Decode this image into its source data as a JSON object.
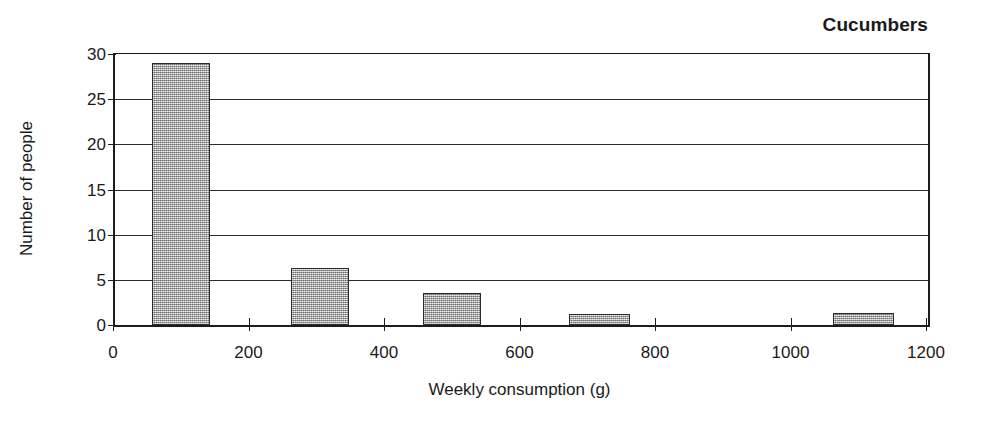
{
  "chart_data": {
    "type": "bar",
    "title": "Cucumbers",
    "xlabel": "Weekly consumption (g)",
    "ylabel": "Number of people",
    "xlim": [
      0,
      1200
    ],
    "ylim": [
      0,
      30
    ],
    "grid": true,
    "legend": "none",
    "xticks": [
      0,
      200,
      400,
      600,
      800,
      1000,
      1200
    ],
    "xtick_labels": [
      "0",
      "200",
      "400",
      "600",
      "800",
      "1000",
      "1200"
    ],
    "yticks": [
      0,
      5,
      10,
      15,
      20,
      25,
      30
    ],
    "ytick_labels": [
      "0",
      "5",
      "10",
      "15",
      "20",
      "25",
      "30"
    ],
    "bars": [
      {
        "bin_start": 55,
        "bin_end": 140,
        "value": 29.0
      },
      {
        "bin_start": 260,
        "bin_end": 345,
        "value": 6.3
      },
      {
        "bin_start": 455,
        "bin_end": 540,
        "value": 3.5
      },
      {
        "bin_start": 670,
        "bin_end": 760,
        "value": 1.2
      },
      {
        "bin_start": 1060,
        "bin_end": 1150,
        "value": 1.3
      }
    ],
    "categories": [
      "55-140",
      "260-345",
      "455-540",
      "670-760",
      "1060-1150"
    ],
    "values": [
      29.0,
      6.3,
      3.5,
      1.2,
      1.3
    ],
    "colors": {
      "bar_fill": "#a9a9a9",
      "bar_border": "#2b2b2b",
      "axis": "#1c1c1c",
      "grid": "#2a2a2a",
      "text": "#1a1a1a",
      "background": "#ffffff"
    }
  }
}
